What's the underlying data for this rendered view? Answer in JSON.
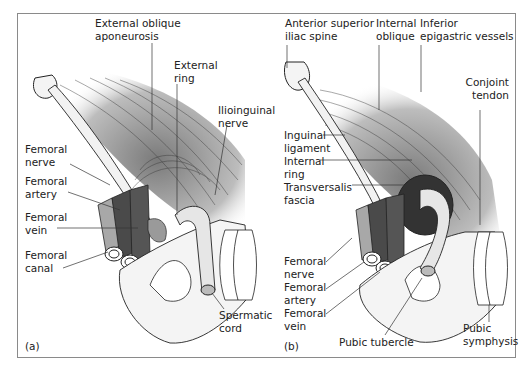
{
  "figure": {
    "panels": [
      {
        "id": "a",
        "panel_label": "(a)",
        "labels": {
          "external_oblique_aponeurosis": "External oblique\naponeurosis",
          "external_ring": "External\nring",
          "ilioinguinal_nerve": "Ilioinguinal\nnerve",
          "femoral_nerve": "Femoral\nnerve",
          "femoral_artery": "Femoral\nartery",
          "femoral_vein": "Femoral\nvein",
          "femoral_canal": "Femoral\ncanal",
          "spermatic_cord": "Spermatic\ncord"
        }
      },
      {
        "id": "b",
        "panel_label": "(b)",
        "labels": {
          "anterior_superior_iliac_spine": "Anterior superior\niliac spine",
          "internal_oblique": "Internal\noblique",
          "inferior_epigastric_vessels": "Inferior\nepigastric vessels",
          "conjoint_tendon": "Conjoint\ntendon",
          "inguinal_ligament": "Inguinal\nligament",
          "internal_ring": "Internal\nring",
          "transversalis_fascia": "Transversalis\nfascia",
          "femoral_nerve": "Femoral\nnerve",
          "femoral_artery": "Femoral\nartery",
          "femoral_vein": "Femoral\nvein",
          "pubic_tubercle": "Pubic tubercle",
          "pubic_symphysis": "Pubic\nsymphysis"
        }
      }
    ],
    "colors": {
      "muscle_gray": "#8c8c8c",
      "vessel_dark": "#4a4a4a",
      "nerve_light": "#a8a8a8",
      "bone": "#f2f2f2",
      "outline": "#222222",
      "frame": "#8a8a8a"
    }
  }
}
